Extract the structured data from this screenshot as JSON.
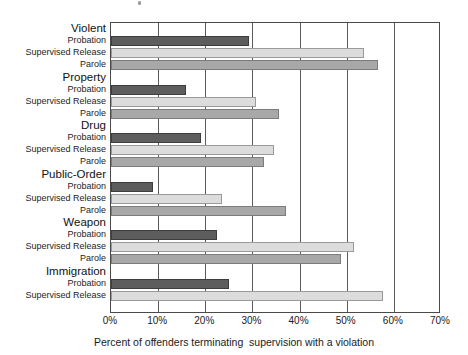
{
  "chart_data": {
    "type": "bar",
    "orientation": "horizontal",
    "title": "",
    "xlabel": "Percent of offenders terminating  supervision with a violation",
    "ylabel": "",
    "xlim": [
      0,
      70
    ],
    "xtick_labels": [
      "0%",
      "10%",
      "20%",
      "30%",
      "40%",
      "50%",
      "60%",
      "70%"
    ],
    "xtick_values": [
      0,
      10,
      20,
      30,
      40,
      50,
      60,
      70
    ],
    "grid": true,
    "legend": "none",
    "series_names": [
      "Probation",
      "Supervised Release",
      "Parole"
    ],
    "series_colors": {
      "probation": "#5d5d5d",
      "supervised_release": "#dcdcdc",
      "parole": "#a8a8a8"
    },
    "categories": [
      "Violent",
      "Property",
      "Drug",
      "Public-Order",
      "Weapon",
      "Immigration"
    ],
    "groups": [
      {
        "category": "Violent",
        "bars": [
          {
            "label": "Probation",
            "series": "probation",
            "value": 29.3
          },
          {
            "label": "Supervised Release",
            "series": "supervised",
            "value": 53.7
          },
          {
            "label": "Parole",
            "series": "parole",
            "value": 56.7
          }
        ]
      },
      {
        "category": "Property",
        "bars": [
          {
            "label": "Probation",
            "series": "probation",
            "value": 15.9
          },
          {
            "label": "Supervised Release",
            "series": "supervised",
            "value": 30.8
          },
          {
            "label": "Parole",
            "series": "parole",
            "value": 35.7
          }
        ]
      },
      {
        "category": "Drug",
        "bars": [
          {
            "label": "Probation",
            "series": "probation",
            "value": 19.1
          },
          {
            "label": "Supervised Release",
            "series": "supervised",
            "value": 34.6
          },
          {
            "label": "Parole",
            "series": "parole",
            "value": 32.5
          }
        ]
      },
      {
        "category": "Public-Order",
        "bars": [
          {
            "label": "Probation",
            "series": "probation",
            "value": 8.9
          },
          {
            "label": "Supervised Release",
            "series": "supervised",
            "value": 23.6
          },
          {
            "label": "Parole",
            "series": "parole",
            "value": 37.2
          }
        ]
      },
      {
        "category": "Weapon",
        "bars": [
          {
            "label": "Probation",
            "series": "probation",
            "value": 22.5
          },
          {
            "label": "Supervised Release",
            "series": "supervised",
            "value": 51.6
          },
          {
            "label": "Parole",
            "series": "parole",
            "value": 48.8
          }
        ]
      },
      {
        "category": "Immigration",
        "bars": [
          {
            "label": "Probation",
            "series": "probation",
            "value": 25.1
          },
          {
            "label": "Supervised Release",
            "series": "supervised",
            "value": 57.8
          }
        ]
      }
    ]
  }
}
